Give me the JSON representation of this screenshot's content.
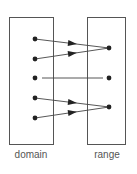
{
  "diagram": {
    "type": "function-mapping",
    "colors": {
      "stroke": "#555555",
      "dot": "#222222",
      "text": "#555555"
    },
    "domain": {
      "label": "domain",
      "box": {
        "x": 9,
        "y": 17,
        "w": 44,
        "h": 127
      },
      "points": [
        {
          "id": "d1",
          "x": 35,
          "y": 39
        },
        {
          "id": "d2",
          "x": 35,
          "y": 59
        },
        {
          "id": "d3",
          "x": 35,
          "y": 78
        },
        {
          "id": "d4",
          "x": 35,
          "y": 98
        },
        {
          "id": "d5",
          "x": 35,
          "y": 118
        }
      ]
    },
    "range": {
      "label": "range",
      "box": {
        "x": 87,
        "y": 17,
        "w": 38,
        "h": 127
      },
      "points": [
        {
          "id": "r1",
          "x": 109,
          "y": 48
        },
        {
          "id": "r2",
          "x": 109,
          "y": 78
        },
        {
          "id": "r3",
          "x": 109,
          "y": 107
        }
      ]
    },
    "mappings": [
      {
        "from": "d1",
        "to": "r1",
        "arrow": true
      },
      {
        "from": "d2",
        "to": "r1",
        "arrow": true
      },
      {
        "from": "d3",
        "to": "r2",
        "arrow": false
      },
      {
        "from": "d4",
        "to": "r3",
        "arrow": true
      },
      {
        "from": "d5",
        "to": "r3",
        "arrow": true
      }
    ]
  }
}
